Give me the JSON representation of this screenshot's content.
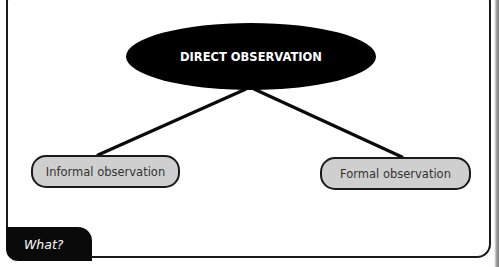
{
  "diagram": {
    "type": "concept-map",
    "root": {
      "label": "DIRECT OBSERVATION",
      "fill": "#000000",
      "text_color": "#ffffff"
    },
    "children": [
      {
        "label": "Informal observation",
        "fill": "#cfcfcf"
      },
      {
        "label": "Formal observation",
        "fill": "#cfcfcf"
      }
    ],
    "edges": [
      {
        "from": "DIRECT OBSERVATION",
        "to": "Informal observation"
      },
      {
        "from": "DIRECT OBSERVATION",
        "to": "Formal observation"
      }
    ]
  },
  "tab": {
    "label": "What?"
  },
  "colors": {
    "border": "#1a1a1a",
    "background": "#ffffff"
  }
}
